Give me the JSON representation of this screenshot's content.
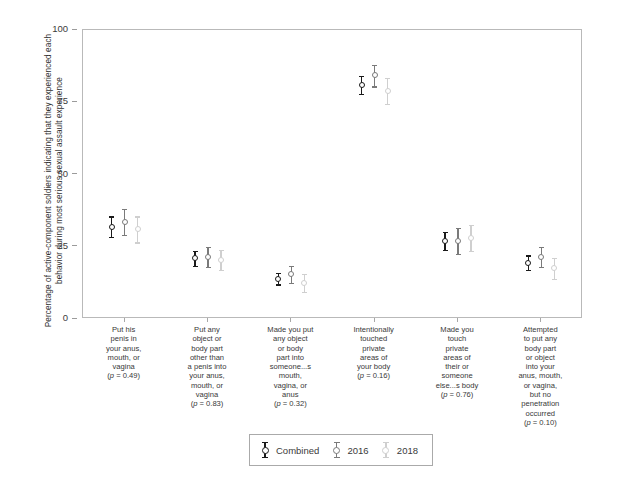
{
  "chart_data": {
    "type": "scatter",
    "title": "",
    "xlabel": "",
    "ylabel": "Percentage of active-component soldiers indicating that they experienced each behavior during most serious sexual assault experience",
    "ylim": [
      0,
      100
    ],
    "yticks": [
      0,
      25,
      50,
      75,
      100
    ],
    "ytick_labels": [
      "0",
      "25",
      "50",
      "75",
      "100"
    ],
    "grid": false,
    "legend_position": "bottom-center",
    "legend_entries": [
      "Combined",
      "2016",
      "2018"
    ],
    "series_colors": [
      "#1a1a1a",
      "#7a7a7a",
      "#cfcfcf"
    ],
    "categories": [
      {
        "label_lines": [
          "Put his",
          "penis in",
          "your anus,",
          "mouth, or",
          "vagina"
        ],
        "pvalue": "(p = 0.49)"
      },
      {
        "label_lines": [
          "Put any",
          "object or",
          "body part",
          "other than",
          "a penis into",
          "your anus,",
          "mouth, or",
          "vagina"
        ],
        "pvalue": "(p = 0.83)"
      },
      {
        "label_lines": [
          "Made you put",
          "any object",
          "or body",
          "part into",
          "someone...s",
          "mouth,",
          "vagina, or",
          "anus"
        ],
        "pvalue": "(p = 0.32)"
      },
      {
        "label_lines": [
          "Intentionally",
          "touched",
          "private",
          "areas of",
          "your body"
        ],
        "pvalue": "(p = 0.16)"
      },
      {
        "label_lines": [
          "Made you",
          "touch",
          "private",
          "areas of",
          "their or",
          "someone",
          "else...s body"
        ],
        "pvalue": "(p = 0.76)"
      },
      {
        "label_lines": [
          "Attempted",
          "to put any",
          "body part",
          "or object",
          "into your",
          "anus, mouth,",
          "or vagina,",
          "but no",
          "penetration",
          "occurred"
        ],
        "pvalue": "(p = 0.10)"
      }
    ],
    "series": [
      {
        "name": "Combined",
        "color": "#1a1a1a",
        "values": [
          32.0,
          21.0,
          14.0,
          81.0,
          27.0,
          19.5
        ],
        "ci_low": [
          28.5,
          18.5,
          12.0,
          78.0,
          24.0,
          17.0
        ],
        "ci_high": [
          35.5,
          23.5,
          16.0,
          84.0,
          30.0,
          22.0
        ]
      },
      {
        "name": "2016",
        "color": "#7a7a7a",
        "values": [
          33.5,
          21.5,
          15.5,
          84.5,
          27.0,
          21.5
        ],
        "ci_low": [
          29.0,
          18.0,
          12.5,
          80.5,
          22.5,
          18.0
        ],
        "ci_high": [
          38.0,
          25.0,
          18.5,
          88.0,
          31.5,
          25.0
        ]
      },
      {
        "name": "2018",
        "color": "#cfcfcf",
        "values": [
          31.0,
          20.5,
          12.5,
          79.0,
          28.0,
          17.5
        ],
        "ci_low": [
          26.5,
          17.0,
          9.5,
          74.5,
          23.5,
          14.0
        ],
        "ci_high": [
          35.5,
          24.0,
          15.5,
          83.5,
          32.5,
          21.0
        ]
      }
    ]
  },
  "axis": {
    "y_title": "Percentage of active-component soldiers indicating that they experienced each behavior during most serious sexual assault experience"
  }
}
